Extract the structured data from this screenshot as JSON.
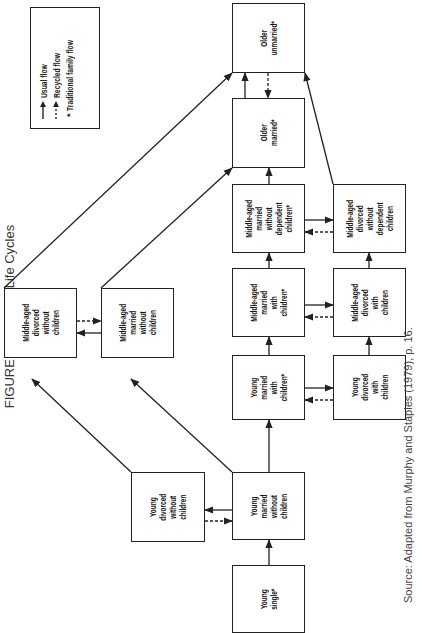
{
  "figure": {
    "title": "FIGURE 4.1. Family Life Cycles",
    "source": "Source: Adapted from Murphy and Staples (1979), p. 16."
  },
  "legend": {
    "items": [
      {
        "symbol": "solid-arrow",
        "label": "Usual flow"
      },
      {
        "symbol": "dashed-arrow",
        "label": "Recycled flow"
      },
      {
        "symbol": "asterisk",
        "label": "Traditional family flow"
      }
    ],
    "asterisk_glyph": "*"
  },
  "nodes": {
    "young_single": "Young\nsingle*",
    "young_married_no_children": "Young\nmarried\nwithout\nchildren",
    "young_divorced_no_children": "Young\ndivorced\nwithout\nchildren",
    "young_married_with_children": "Young\nmarried\nwith\nchildren*",
    "young_divorced_with_children": "Young\ndivorced\nwith\nchildren",
    "middle_married_with_children": "Middle-aged\nmarried\nwith\nchildren*",
    "middle_divorced_with_children": "Middle-aged\ndivorced\nwith\nchildren",
    "middle_married_no_dependent": "Middle-aged\nmarried\nwithout\ndependent\nchildren*",
    "middle_divorced_no_dependent": "Middle-aged\ndivorced\nwithout\ndependent\nchildren",
    "middle_married_no_children": "Middle-aged\nmarried\nwithout\nchildren",
    "middle_divorced_no_children": "Middle-aged\ndivorced\nwithout\nchildren",
    "older_married": "Older\nmarried*",
    "older_unmarried": "Older\nunmarried*"
  },
  "edges": [
    {
      "from": "young_single",
      "to": "young_married_no_children",
      "type": "usual"
    },
    {
      "from": "young_married_no_children",
      "to": "young_divorced_no_children",
      "type": "usual"
    },
    {
      "from": "young_divorced_no_children",
      "to": "young_married_no_children",
      "type": "recycled"
    },
    {
      "from": "young_married_no_children",
      "to": "young_married_with_children",
      "type": "usual"
    },
    {
      "from": "young_married_no_children",
      "to": "middle_married_no_children",
      "type": "usual"
    },
    {
      "from": "young_divorced_no_children",
      "to": "middle_divorced_no_children",
      "type": "usual"
    },
    {
      "from": "middle_married_no_children",
      "to": "middle_divorced_no_children",
      "type": "usual"
    },
    {
      "from": "middle_divorced_no_children",
      "to": "middle_married_no_children",
      "type": "recycled"
    },
    {
      "from": "young_married_with_children",
      "to": "young_divorced_with_children",
      "type": "usual"
    },
    {
      "from": "young_divorced_with_children",
      "to": "young_married_with_children",
      "type": "recycled"
    },
    {
      "from": "young_married_with_children",
      "to": "middle_married_with_children",
      "type": "usual"
    },
    {
      "from": "young_divorced_with_children",
      "to": "middle_divorced_with_children",
      "type": "usual"
    },
    {
      "from": "middle_married_with_children",
      "to": "middle_divorced_with_children",
      "type": "usual"
    },
    {
      "from": "middle_divorced_with_children",
      "to": "middle_married_with_children",
      "type": "recycled"
    },
    {
      "from": "middle_married_with_children",
      "to": "middle_married_no_dependent",
      "type": "usual"
    },
    {
      "from": "middle_divorced_with_children",
      "to": "middle_divorced_no_dependent",
      "type": "usual"
    },
    {
      "from": "middle_married_no_dependent",
      "to": "middle_divorced_no_dependent",
      "type": "usual"
    },
    {
      "from": "middle_divorced_no_dependent",
      "to": "middle_married_no_dependent",
      "type": "recycled"
    },
    {
      "from": "middle_married_no_dependent",
      "to": "older_married",
      "type": "usual"
    },
    {
      "from": "middle_married_no_children",
      "to": "older_married",
      "type": "usual"
    },
    {
      "from": "middle_divorced_no_children",
      "to": "older_unmarried",
      "type": "usual"
    },
    {
      "from": "middle_divorced_no_dependent",
      "to": "older_unmarried",
      "type": "usual"
    },
    {
      "from": "older_married",
      "to": "older_unmarried",
      "type": "usual"
    },
    {
      "from": "older_unmarried",
      "to": "older_married",
      "type": "recycled"
    }
  ]
}
